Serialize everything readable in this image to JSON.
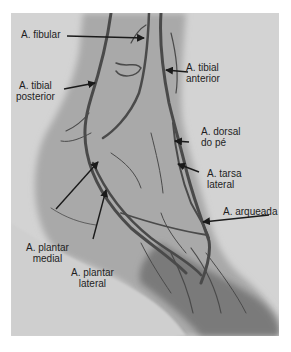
{
  "figure": {
    "type": "angiogram",
    "colors": {
      "background": "#d3d3d3",
      "soft_tissue": "#a8a8a8",
      "vessel": "#4a4a4a",
      "arrow": "#1a1a1a",
      "text": "#1e1e1e"
    },
    "labels": [
      {
        "id": "fibular",
        "lines": [
          "A. fibular"
        ]
      },
      {
        "id": "tibial-anterior",
        "lines": [
          "A. tibial",
          "anterior"
        ]
      },
      {
        "id": "tibial-posterior",
        "lines": [
          "A. tibial",
          "posterior"
        ]
      },
      {
        "id": "dorsal-pe",
        "lines": [
          "A. dorsal",
          "do pé"
        ]
      },
      {
        "id": "tarsa-lateral",
        "lines": [
          "A. tarsa",
          "lateral"
        ]
      },
      {
        "id": "arqueada",
        "lines": [
          "A. arqueada"
        ]
      },
      {
        "id": "plantar-medial",
        "lines": [
          "A. plantar",
          "medial"
        ]
      },
      {
        "id": "plantar-lateral",
        "lines": [
          "A. plantar",
          "lateral"
        ]
      }
    ]
  }
}
